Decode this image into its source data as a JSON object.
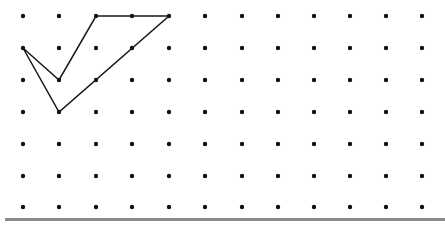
{
  "diagram": {
    "type": "dot-grid-polygon",
    "grid": {
      "columns": 12,
      "rows": 7,
      "x_positions": [
        23,
        59,
        96,
        132,
        169,
        205,
        242,
        278,
        314,
        350,
        386,
        422
      ],
      "y_positions": [
        16,
        48,
        80,
        112,
        144,
        176,
        207
      ],
      "dot_radius": 2.2,
      "dot_color": "#111111"
    },
    "polygon": {
      "stroke": "#1a1a1a",
      "stroke_width": 1.5,
      "vertices_grid": [
        [
          2,
          0
        ],
        [
          4,
          0
        ],
        [
          1,
          3
        ],
        [
          0,
          1
        ],
        [
          1,
          2
        ]
      ],
      "vertices_px": [
        [
          96,
          16
        ],
        [
          169,
          16
        ],
        [
          59,
          112
        ],
        [
          23,
          48
        ],
        [
          59,
          80
        ]
      ]
    },
    "baseline": {
      "color": "#8a8a8a"
    }
  }
}
